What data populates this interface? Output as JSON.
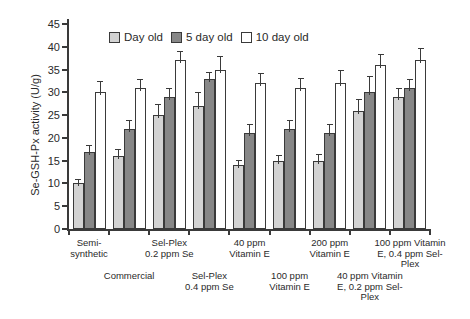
{
  "chart_data": {
    "type": "bar",
    "title": "",
    "xlabel": "",
    "ylabel": "Se-GSH-Px activity (U/g)",
    "ylim": [
      0,
      45
    ],
    "ytick_step": 5,
    "yticks": [
      0,
      5,
      10,
      15,
      20,
      25,
      30,
      35,
      40,
      45
    ],
    "grid": false,
    "legend_position": "top-inside",
    "categories": [
      "Semi-\nsynthetic",
      "Commercial",
      "Sel-Plex\n0.2 ppm Se",
      "Sel-Plex\n0.4 ppm Se",
      "40 ppm\nVitamin E",
      "100 ppm\nVitamin E",
      "200 ppm\nVitamin E",
      "40 ppm Vitamin\nE, 0.2 ppm Sel-\nPlex",
      "100 ppm Vitamin\nE, 0.4 ppm Sel-\nPlex"
    ],
    "category_label_rows": [
      1,
      2,
      1,
      2,
      1,
      2,
      1,
      2,
      1
    ],
    "series": [
      {
        "name": "Day old",
        "color": "#d3d3d3",
        "values": [
          10,
          16,
          25,
          27,
          14,
          15,
          15,
          26,
          29
        ],
        "errors": [
          1,
          1.5,
          2.5,
          3,
          1.2,
          1.2,
          1.5,
          2.5,
          2
        ]
      },
      {
        "name": "5 day old",
        "color": "#878787",
        "values": [
          17,
          22,
          29,
          33,
          21,
          22,
          21,
          30,
          31
        ],
        "errors": [
          1.5,
          2,
          2,
          1.5,
          2,
          2,
          2,
          3.5,
          2
        ]
      },
      {
        "name": "10 day old",
        "color": "#ffffff",
        "values": [
          30,
          31,
          37,
          35,
          32,
          31,
          32,
          36,
          37
        ],
        "errors": [
          2.5,
          2,
          2,
          3,
          2.2,
          2.2,
          3,
          2.5,
          2.8
        ]
      }
    ]
  },
  "colors": {
    "axis": "#3a3a3a",
    "text": "#2a2a2a",
    "bar_border": "#3a3a3a",
    "background": "#ffffff"
  }
}
